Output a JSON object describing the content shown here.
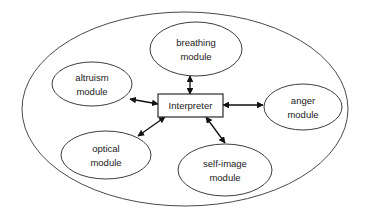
{
  "diagram": {
    "background_color": "#ffffff",
    "outline_color": "#4a4a4a",
    "connector_color": "#111111",
    "text_color": "#1a1a1a",
    "container": {
      "shape": "ellipse",
      "label": ""
    },
    "center": {
      "shape": "rectangle",
      "label": "Interpreter"
    },
    "modules": [
      {
        "id": "breathing",
        "label_line1": "breathing",
        "label_line2": "module",
        "position": "top"
      },
      {
        "id": "altruism",
        "label_line1": "altruism",
        "label_line2": "module",
        "position": "upper-left"
      },
      {
        "id": "anger",
        "label_line1": "anger",
        "label_line2": "module",
        "position": "right"
      },
      {
        "id": "optical",
        "label_line1": "optical",
        "label_line2": "module",
        "position": "lower-left"
      },
      {
        "id": "self-image",
        "label_line1": "self-image",
        "label_line2": "module",
        "position": "bottom"
      }
    ],
    "connections": [
      {
        "from": "Interpreter",
        "to": "breathing module",
        "arrow": "double"
      },
      {
        "from": "Interpreter",
        "to": "altruism module",
        "arrow": "double"
      },
      {
        "from": "Interpreter",
        "to": "anger module",
        "arrow": "double"
      },
      {
        "from": "Interpreter",
        "to": "optical module",
        "arrow": "double"
      },
      {
        "from": "Interpreter",
        "to": "self-image module",
        "arrow": "double"
      }
    ]
  }
}
